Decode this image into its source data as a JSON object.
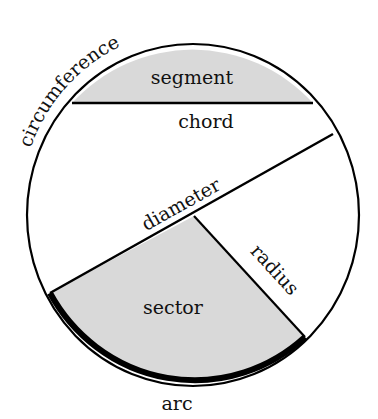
{
  "diagram": {
    "labels": {
      "circumference": "circumference",
      "segment": "segment",
      "chord": "chord",
      "diameter": "diameter",
      "radius": "radius",
      "sector": "sector",
      "arc": "arc"
    },
    "colors": {
      "stroke": "#000000",
      "shade": "#d9d9d9",
      "background": "#ffffff",
      "text": "#111111"
    }
  }
}
